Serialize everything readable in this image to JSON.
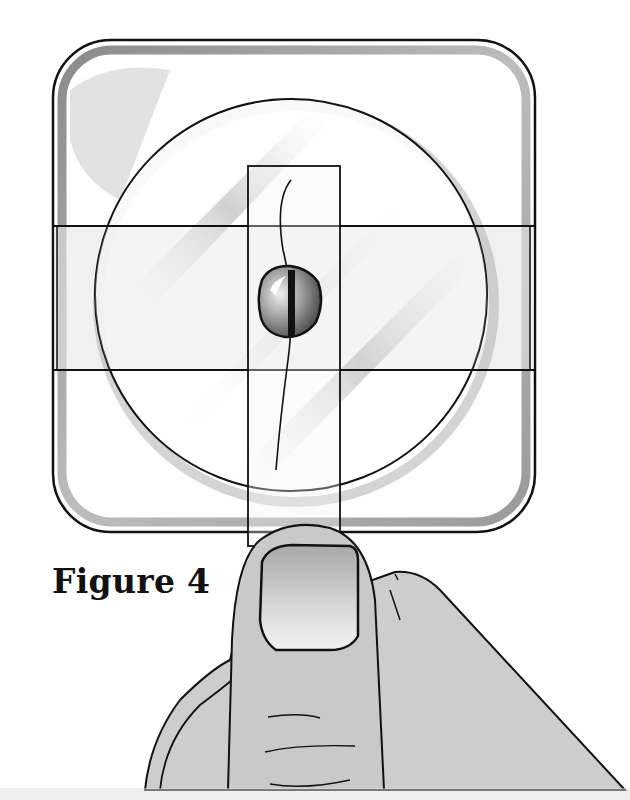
{
  "figure": {
    "caption": "Figure 4",
    "colors": {
      "line": "#111111",
      "shade": "#9a9a9a",
      "skin": "#cfcfcf",
      "nail": "#e6e6e6",
      "background": "#ffffff"
    }
  }
}
